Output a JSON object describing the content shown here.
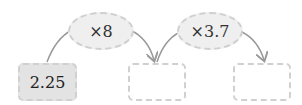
{
  "boxes": [
    {
      "value": "2.25",
      "filled": true
    },
    {
      "value": "",
      "filled": false
    },
    {
      "value": "",
      "filled": false
    }
  ],
  "operators": [
    {
      "label": "×8"
    },
    {
      "label": "×3.7"
    }
  ],
  "colors": {
    "arrow": "#9a9a9a",
    "border": "#d0d0d0",
    "fill": "#e3e3e3"
  }
}
